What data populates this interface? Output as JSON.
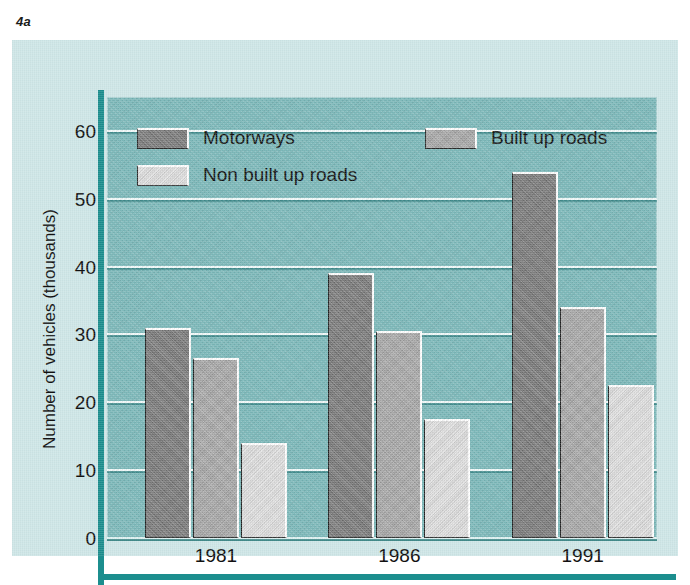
{
  "figure": {
    "label": "4a"
  },
  "colors": {
    "panel_background": "#cfe7e8",
    "plot_background": "#7cb9ba",
    "axis_rule": "#1c8e8e",
    "gridline": "#f2fbfb",
    "motorways": "#787878",
    "built_up_roads": "#a8a8a8",
    "non_built_up_roads": "#e2e2e2",
    "text": "#111111"
  },
  "chart_data": {
    "type": "bar",
    "title": "",
    "xlabel": "",
    "ylabel": "Number of vehicles (thousands)",
    "categories": [
      "1981",
      "1986",
      "1991"
    ],
    "series": [
      {
        "name": "Motorways",
        "color": "#787878",
        "values": [
          31,
          39,
          54
        ]
      },
      {
        "name": "Built up roads",
        "color": "#a8a8a8",
        "values": [
          26.5,
          30.5,
          34
        ]
      },
      {
        "name": "Non built up roads",
        "color": "#e2e2e2",
        "values": [
          14,
          17.5,
          22.5
        ]
      }
    ],
    "ylim": [
      0,
      65
    ],
    "yticks": [
      0,
      10,
      20,
      30,
      40,
      50,
      60
    ],
    "ytick_labels": [
      "0",
      "10",
      "20",
      "30",
      "40",
      "50",
      "60"
    ],
    "grid": true,
    "legend_position": "inside-top-left"
  },
  "legend": {
    "entries": [
      {
        "label": "Motorways",
        "swatch": "motorways-swatch"
      },
      {
        "label": "Built up roads",
        "swatch": "built-up-roads-swatch"
      },
      {
        "label": "Non built up roads",
        "swatch": "non-built-up-roads-swatch"
      }
    ]
  }
}
